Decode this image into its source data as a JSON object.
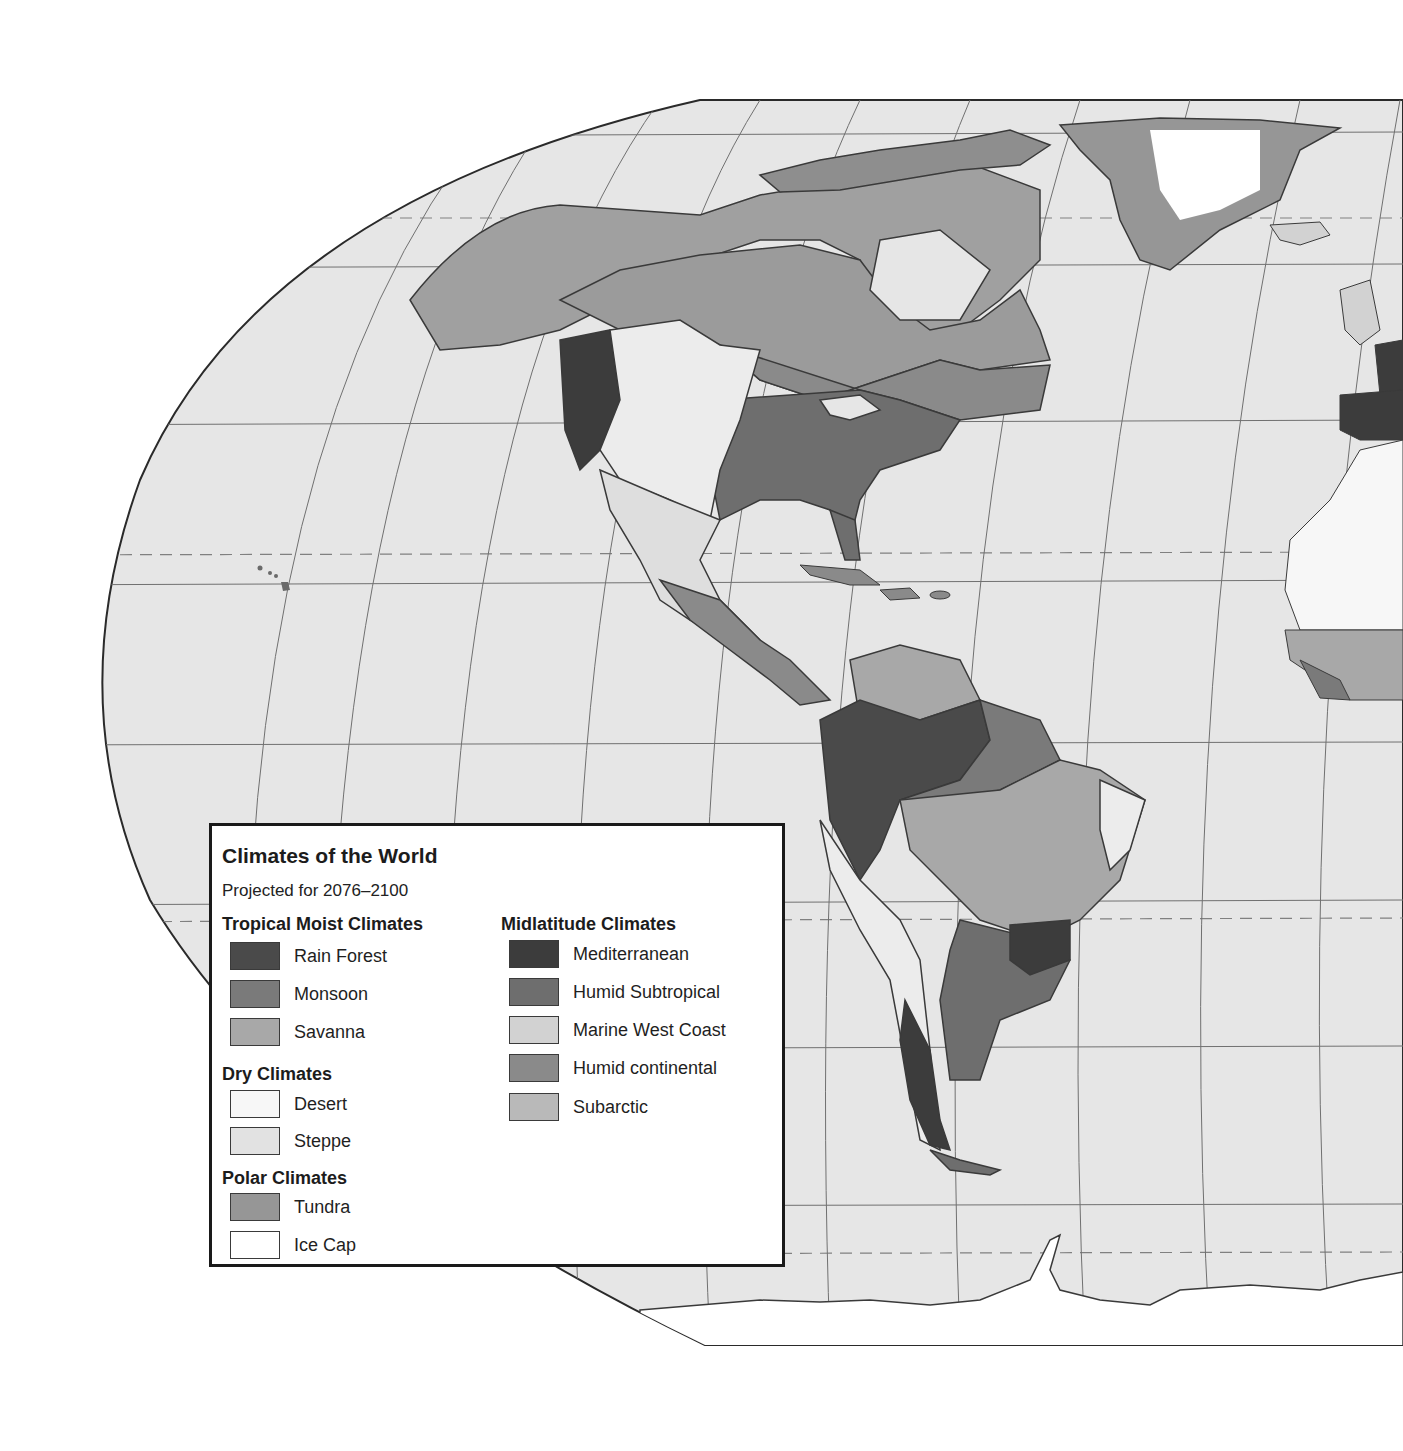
{
  "map": {
    "projection": "Robinson (Western Hemisphere crop)",
    "ocean_color": "#e6e6e6",
    "graticule_color": "#6a6a6a",
    "border_color": "#2a2a2a",
    "regions_visible": [
      "North America",
      "Greenland",
      "Iceland",
      "Central America",
      "Caribbean",
      "South America",
      "Antarctica",
      "Western Europe",
      "West Africa",
      "Hawaii"
    ]
  },
  "legend": {
    "title": "Climates of the World",
    "subtitle": "Projected for 2076–2100",
    "groups": [
      {
        "heading": "Tropical Moist Climates",
        "items": [
          {
            "label": "Rain Forest",
            "color": "#4a4a4a"
          },
          {
            "label": "Monsoon",
            "color": "#7a7a7a"
          },
          {
            "label": "Savanna",
            "color": "#a8a8a8"
          }
        ]
      },
      {
        "heading": "Dry Climates",
        "items": [
          {
            "label": "Desert",
            "color": "#f7f7f7"
          },
          {
            "label": "Steppe",
            "color": "#e2e2e2"
          }
        ]
      },
      {
        "heading": "Polar Climates",
        "items": [
          {
            "label": "Tundra",
            "color": "#969696"
          },
          {
            "label": "Ice Cap",
            "color": "#ffffff"
          }
        ]
      },
      {
        "heading": "Midlatitude Climates",
        "items": [
          {
            "label": "Mediterranean",
            "color": "#3c3c3c"
          },
          {
            "label": "Humid Subtropical",
            "color": "#6e6e6e"
          },
          {
            "label": "Marine West Coast",
            "color": "#d2d2d2"
          },
          {
            "label": "Humid continental",
            "color": "#8a8a8a"
          },
          {
            "label": "Subarctic",
            "color": "#b9b9b9"
          }
        ]
      }
    ]
  }
}
